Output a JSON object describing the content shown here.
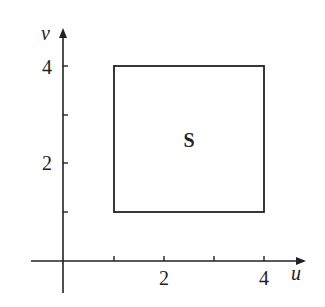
{
  "diagram": {
    "type": "region-in-uv-plane",
    "axes": {
      "horizontal": {
        "label": "u",
        "ticks": [
          1,
          2,
          3,
          4
        ],
        "tick_labels": [
          "2",
          "4"
        ],
        "tick_label_values": [
          2,
          4
        ]
      },
      "vertical": {
        "label": "v",
        "ticks": [
          1,
          2,
          3,
          4
        ],
        "tick_labels": [
          "2",
          "4"
        ],
        "tick_label_values": [
          2,
          4
        ]
      }
    },
    "region": {
      "label": "S",
      "shape": "rectangle",
      "u_range": [
        1,
        4
      ],
      "v_range": [
        1,
        4
      ]
    },
    "colors": {
      "stroke": "#222222",
      "background": "#ffffff"
    }
  }
}
